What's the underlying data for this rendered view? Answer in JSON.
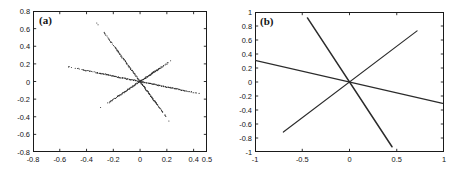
{
  "figure": {
    "background": "#ffffff",
    "line_color": "#2b2b2b",
    "axis_color": "#1a1a1a",
    "text_color": "#131313"
  },
  "panels": [
    {
      "id": "a",
      "label": "(a)",
      "box": {
        "left": 33,
        "top": 11,
        "width": 174,
        "height": 141
      },
      "label_pos": {
        "left": 39,
        "top": 14
      }
    },
    {
      "id": "b",
      "label": "(b)",
      "box": {
        "left": 255,
        "top": 12,
        "width": 189,
        "height": 140
      },
      "label_pos": {
        "left": 260,
        "top": 15
      }
    }
  ],
  "chart_data": [
    {
      "type": "scatter",
      "panel": "a",
      "title": "(a)",
      "xlabel": "",
      "ylabel": "",
      "xlim": [
        -0.8,
        0.5
      ],
      "ylim": [
        -0.8,
        0.8
      ],
      "xticks": [
        -0.8,
        -0.6,
        -0.4,
        -0.2,
        0,
        0.2,
        0.4,
        0.5
      ],
      "xticklabels": [
        "-0.8",
        "-0.6",
        "-0.4",
        "-0.2",
        "0",
        "0.2",
        "0.4",
        "0.5"
      ],
      "yticks": [
        -0.8,
        -0.6,
        -0.4,
        -0.2,
        0,
        0.2,
        0.4,
        0.6,
        0.8
      ],
      "yticklabels": [
        "-0.8",
        "-0.6",
        "-0.4",
        "-0.2",
        "0",
        "0.2",
        "0.4",
        "0.6",
        "0.8"
      ],
      "grid": false,
      "legend": "none",
      "marker": "dot",
      "description": "Three collinear point clouds crossing at the origin; density is high near the origin and falls off toward the tips where points become sparse dots.",
      "series": [
        {
          "name": "direction-1-steep-negative",
          "slope": -2.06,
          "x_start": -0.325,
          "x_end": 0.222,
          "y_start": 0.67,
          "y_end": -0.458,
          "n_points": 170
        },
        {
          "name": "direction-2-positive",
          "slope": 1.02,
          "x_start": -0.305,
          "x_end": 0.232,
          "y_start": -0.312,
          "y_end": 0.237,
          "n_points": 150
        },
        {
          "name": "direction-3-shallow-negative",
          "slope": -0.31,
          "x_start": -0.545,
          "x_end": 0.54,
          "y_start": 0.17,
          "y_end": -0.168,
          "n_points": 190
        }
      ]
    },
    {
      "type": "line",
      "panel": "b",
      "title": "(b)",
      "xlabel": "",
      "ylabel": "",
      "xlim": [
        -1,
        1
      ],
      "ylim": [
        -1,
        1
      ],
      "xticks": [
        -1,
        -0.5,
        0,
        0.5,
        1
      ],
      "xticklabels": [
        "-1",
        "-0.5",
        "0",
        "0.5",
        "1"
      ],
      "yticks": [
        -1,
        -0.8,
        -0.6,
        -0.4,
        -0.2,
        0,
        0.2,
        0.4,
        0.6,
        0.8,
        1
      ],
      "yticklabels": [
        "-1",
        "-0.8",
        "-0.6",
        "-0.4",
        "-0.2",
        "0",
        "0.2",
        "0.4",
        "0.6",
        "0.8",
        "1"
      ],
      "grid": false,
      "legend": "none",
      "description": "Three straight basis lines drawn through the origin, matching the three point-cloud directions of panel (a).",
      "series": [
        {
          "name": "direction-1-steep-negative",
          "slope": -2.06,
          "x_start": -0.445,
          "x_end": 0.45,
          "y_start": 0.915,
          "y_end": -0.925
        },
        {
          "name": "direction-2-positive",
          "slope": 1.02,
          "x_start": -0.7,
          "x_end": 0.715,
          "y_start": -0.715,
          "y_end": 0.73
        },
        {
          "name": "direction-3-shallow-negative",
          "slope": -0.31,
          "x_start": -1.0,
          "x_end": 0.985,
          "y_start": 0.31,
          "y_end": -0.305
        }
      ]
    }
  ]
}
